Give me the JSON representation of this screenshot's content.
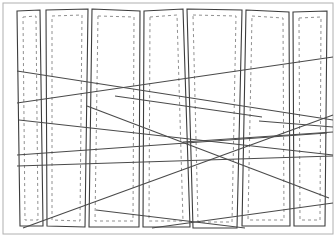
{
  "figure": {
    "width": 336,
    "height": 237,
    "background_color": "#ffffff"
  },
  "style": {
    "frame_color": "#b0b0b0",
    "frame_width": 1,
    "panel_color": "#3c3c3c",
    "panel_width": 1.1,
    "dashed_color": "#909090",
    "dashed_width": 1,
    "dash_pattern": "3 3",
    "line_color": "#4a4a4a",
    "line_width": 1.1
  },
  "frame": {
    "name": "outer-frame",
    "x": 3,
    "y": 3,
    "width": 330,
    "height": 231
  },
  "panels": [
    {
      "id": "panel-1",
      "label": "Panel 1",
      "outline": "17,11 40,10 43,226 20,226",
      "inset": "23,17 36,16 38,220 25,220"
    },
    {
      "id": "panel-2",
      "label": "Panel 2",
      "outline": "46,10 88,9 85,227 47,226",
      "inset": "52,16 82,15 80,221 52,220"
    },
    {
      "id": "panel-3",
      "label": "Panel 3",
      "outline": "92,9 140,11 139,227 89,227",
      "inset": "98,16 134,17 133,221 95,221"
    },
    {
      "id": "panel-4",
      "label": "Panel 4",
      "outline": "144,11 183,9 190,227 143,227",
      "inset": "150,17 177,15 183,221 149,221"
    },
    {
      "id": "panel-5",
      "label": "Panel 5",
      "outline": "187,9 242,10 237,228 193,228",
      "inset": "193,15 236,16 232,222 198,222"
    },
    {
      "id": "panel-6",
      "label": "Panel 6",
      "outline": "246,10 289,12 290,226 242,226",
      "inset": "252,16 283,18 284,220 248,220"
    },
    {
      "id": "panel-7",
      "label": "Panel 7",
      "outline": "293,12 327,11 325,226 294,226",
      "inset": "299,18 321,17 320,220 300,220"
    }
  ],
  "cross_lines": [
    {
      "id": "line-1",
      "label": "Cross line 1",
      "x1": 17,
      "y1": 71,
      "x2": 333,
      "y2": 120
    },
    {
      "id": "line-2",
      "label": "Cross line 2",
      "x1": 17,
      "y1": 103,
      "x2": 333,
      "y2": 57
    },
    {
      "id": "line-3",
      "label": "Cross line 3",
      "x1": 17,
      "y1": 155,
      "x2": 327,
      "y2": 133
    },
    {
      "id": "line-4",
      "label": "Cross line 4",
      "x1": 17,
      "y1": 166,
      "x2": 333,
      "y2": 156
    },
    {
      "id": "line-5",
      "label": "Cross line 5",
      "x1": 19,
      "y1": 120,
      "x2": 333,
      "y2": 155
    },
    {
      "id": "line-6",
      "label": "Cross line 6",
      "x1": 23,
      "y1": 228,
      "x2": 333,
      "y2": 115
    },
    {
      "id": "line-7",
      "label": "Cross line 7",
      "x1": 87,
      "y1": 106,
      "x2": 329,
      "y2": 198
    },
    {
      "id": "line-8",
      "label": "Cross line 8",
      "x1": 115,
      "y1": 96,
      "x2": 262,
      "y2": 117
    },
    {
      "id": "line-9",
      "label": "Cross line 9",
      "x1": 152,
      "y1": 228,
      "x2": 333,
      "y2": 203
    },
    {
      "id": "line-10",
      "label": "Cross line 10",
      "x1": 96,
      "y1": 210,
      "x2": 245,
      "y2": 228
    },
    {
      "id": "line-11",
      "label": "Cross line 11",
      "x1": 259,
      "y1": 121,
      "x2": 333,
      "y2": 127
    },
    {
      "id": "line-12",
      "label": "Cross line 12",
      "x1": 183,
      "y1": 142,
      "x2": 333,
      "y2": 132
    }
  ]
}
